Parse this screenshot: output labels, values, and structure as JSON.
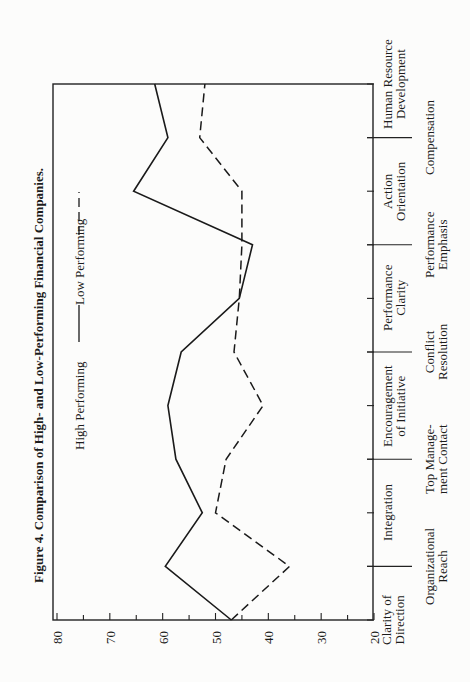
{
  "chart_data": {
    "type": "line",
    "title": "Figure 4. Comparison of High- and Low-Performing Financial Companies.",
    "orientation": "rotated-90-ccw",
    "xlabel": "",
    "ylabel": "",
    "ylim": [
      20,
      80
    ],
    "yticks": [
      80,
      70,
      60,
      50,
      40,
      30,
      20
    ],
    "grid": false,
    "legend_position": "inside-top-left",
    "categories": [
      "Clarity of Direction",
      "Organizational Reach",
      "Integration",
      "Top Management Contact",
      "Encouragement of Initiative",
      "Conflict Resolution",
      "Performance Clarity",
      "Performance Emphasis",
      "Action Orientation",
      "Compensation",
      "Human Resource Development"
    ],
    "series": [
      {
        "name": "High Performing",
        "style": "solid",
        "values": [
          47,
          59.5,
          52.5,
          57.5,
          59,
          56.5,
          45.5,
          43,
          65.5,
          59,
          61.5
        ]
      },
      {
        "name": "Low Performing",
        "style": "dashed",
        "values": [
          47,
          36,
          50,
          48,
          41,
          46.5,
          45.5,
          45,
          45,
          53,
          52
        ]
      }
    ]
  },
  "labels": {
    "title": "Figure 4. Comparison of High- and Low-Performing Financial Companies.",
    "legend_high": "High Performing",
    "legend_low": "Low Performing",
    "ticks": [
      "80",
      "70",
      "60",
      "50",
      "40",
      "30",
      "20"
    ],
    "cat_lines": [
      [
        "Clarity of",
        "Direction"
      ],
      [
        "Organizational",
        "Reach"
      ],
      [
        "Integration"
      ],
      [
        "Top Manage-",
        "ment Contact"
      ],
      [
        "Encouragement",
        "of Initiative"
      ],
      [
        "Conflict",
        "Resolution"
      ],
      [
        "Performance",
        "Clarity"
      ],
      [
        "Performance",
        "Emphasis"
      ],
      [
        "Action",
        "Orientation"
      ],
      [
        "Compensation"
      ],
      [
        "Human Resource",
        "Development"
      ]
    ]
  }
}
